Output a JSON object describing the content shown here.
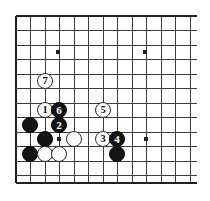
{
  "figure": {
    "kind": "go-board-problem-diagram",
    "background_color": "#ffffff",
    "line_color": "#3c3c3c",
    "edge_color": "#202020",
    "black_stone_color": "#151515",
    "white_stone_color": "#ffffff"
  },
  "board": {
    "left_edge_x": 16,
    "top_edge_y": 16,
    "right_extent_x": 197,
    "bottom_edge_y": 183,
    "spacing": 14.5,
    "columns_x": [
      16,
      30.5,
      45,
      59.5,
      74,
      88.5,
      103,
      117.5,
      132,
      146.5,
      161,
      175.5,
      190
    ],
    "rows_y": [
      16,
      30.5,
      45,
      59.5,
      74,
      88.5,
      103,
      117.5,
      132,
      146.5,
      161,
      175.5
    ],
    "star_points": [
      {
        "x": 58,
        "y": 52
      },
      {
        "x": 145,
        "y": 52
      },
      {
        "x": 59,
        "y": 139
      },
      {
        "x": 146,
        "y": 139
      }
    ],
    "stone_diameter": 16
  },
  "stones": [
    {
      "id": "stone-white-7",
      "color": "white",
      "label": "7",
      "x": 45,
      "y": 81
    },
    {
      "id": "stone-white-1",
      "color": "white",
      "label": "1",
      "x": 45,
      "y": 110
    },
    {
      "id": "stone-black-6",
      "color": "black",
      "label": "6",
      "x": 59,
      "y": 110
    },
    {
      "id": "stone-white-5",
      "color": "white",
      "label": "5",
      "x": 103,
      "y": 110
    },
    {
      "id": "stone-black-plain-a",
      "color": "black",
      "label": "",
      "x": 30,
      "y": 125
    },
    {
      "id": "stone-black-2",
      "color": "black",
      "label": "2",
      "x": 59,
      "y": 125
    },
    {
      "id": "stone-black-plain-b",
      "color": "black",
      "label": "",
      "x": 45,
      "y": 139
    },
    {
      "id": "stone-white-plain-a",
      "color": "white",
      "label": "",
      "x": 74,
      "y": 139
    },
    {
      "id": "stone-white-3",
      "color": "white",
      "label": "3",
      "x": 103,
      "y": 139
    },
    {
      "id": "stone-black-4",
      "color": "black",
      "label": "4",
      "x": 117,
      "y": 139
    },
    {
      "id": "stone-black-plain-c",
      "color": "black",
      "label": "",
      "x": 30,
      "y": 154
    },
    {
      "id": "stone-white-plain-b",
      "color": "white",
      "label": "",
      "x": 45,
      "y": 154
    },
    {
      "id": "stone-white-plain-c",
      "color": "white",
      "label": "",
      "x": 59,
      "y": 154
    },
    {
      "id": "stone-black-plain-d",
      "color": "black",
      "label": "",
      "x": 117,
      "y": 154
    }
  ]
}
